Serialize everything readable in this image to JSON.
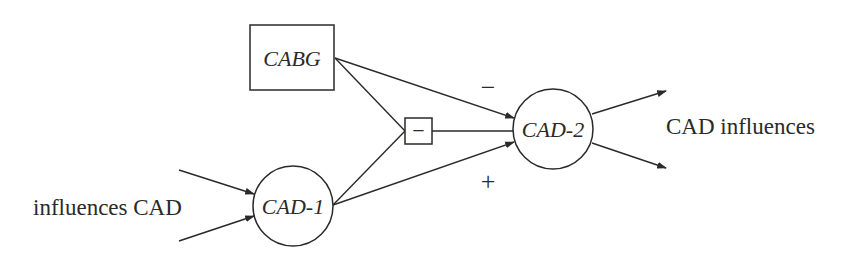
{
  "diagram": {
    "type": "causal-influence-diagram",
    "nodes": {
      "cabg": {
        "label": "CABG",
        "shape": "rectangle",
        "style": "italic"
      },
      "cad1": {
        "label": "CAD-1",
        "shape": "circle",
        "style": "italic"
      },
      "cad2": {
        "label": "CAD-2",
        "shape": "circle",
        "style": "italic"
      },
      "minus_op": {
        "label": "−",
        "shape": "small-square"
      }
    },
    "labels": {
      "input": "influences CAD",
      "output": "CAD influences"
    },
    "edge_signs": {
      "cabg_to_cad2": "−",
      "cad1_to_cad2": "+"
    },
    "edges": [
      {
        "from": "input",
        "to": "CAD-1",
        "arrow": true
      },
      {
        "from": "input",
        "to": "CAD-1",
        "arrow": true
      },
      {
        "from": "CABG",
        "to": "CAD-2",
        "sign": "−",
        "arrow": true
      },
      {
        "from": "CABG",
        "to": "− box",
        "arrow": false
      },
      {
        "from": "CAD-1",
        "to": "− box",
        "arrow": false
      },
      {
        "from": "− box",
        "to": "CAD-2",
        "arrow": false
      },
      {
        "from": "CAD-1",
        "to": "CAD-2",
        "sign": "+",
        "arrow": true
      },
      {
        "from": "CAD-2",
        "to": "output",
        "arrow": true
      },
      {
        "from": "CAD-2",
        "to": "output",
        "arrow": true
      }
    ],
    "colors": {
      "stroke": "#2a2a2a",
      "background": "#ffffff"
    }
  }
}
